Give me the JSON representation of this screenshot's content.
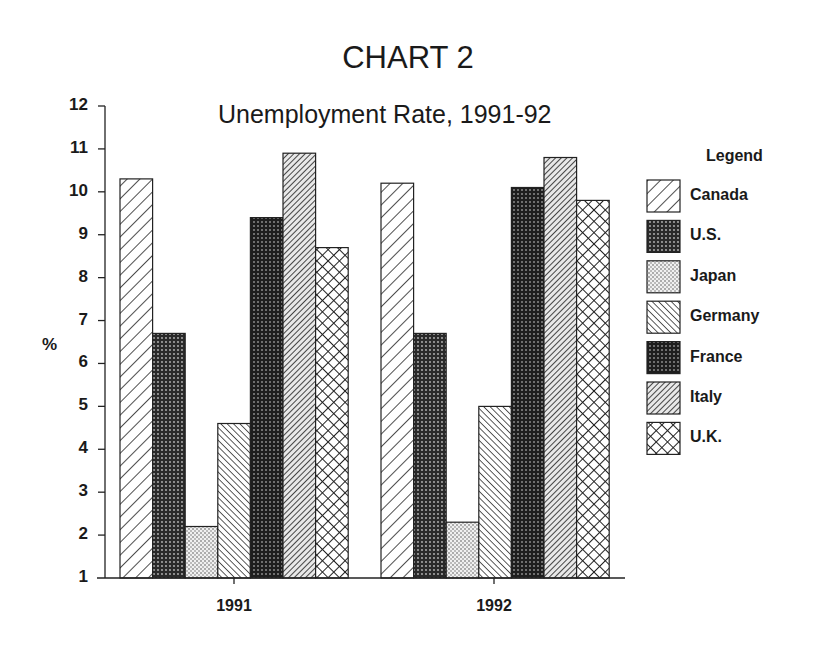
{
  "chart_data": {
    "type": "bar",
    "title": "CHART 2",
    "subtitle": "Unemployment Rate, 1991-92",
    "xlabel": "",
    "ylabel": "%",
    "ylim": [
      1,
      12
    ],
    "yticks": [
      1,
      2,
      3,
      4,
      5,
      6,
      7,
      8,
      9,
      10,
      11,
      12
    ],
    "grid": false,
    "legend_title": "Legend",
    "legend_position": "right",
    "categories": [
      "1991",
      "1992"
    ],
    "series": [
      {
        "name": "Canada",
        "pattern": "wide-diagonal-hatch",
        "values": [
          10.3,
          10.2
        ]
      },
      {
        "name": "U.S.",
        "pattern": "dark-dots",
        "values": [
          6.7,
          6.7
        ]
      },
      {
        "name": "Japan",
        "pattern": "light-dots",
        "values": [
          2.2,
          2.3
        ]
      },
      {
        "name": "Germany",
        "pattern": "back-diagonal-hatch",
        "values": [
          4.6,
          5.0
        ]
      },
      {
        "name": "France",
        "pattern": "dense-dark-dots",
        "values": [
          9.4,
          10.1
        ]
      },
      {
        "name": "Italy",
        "pattern": "dense-diagonal-hatch",
        "values": [
          10.9,
          10.8
        ]
      },
      {
        "name": "U.K.",
        "pattern": "cross-hatch",
        "values": [
          8.7,
          9.8
        ]
      }
    ]
  }
}
